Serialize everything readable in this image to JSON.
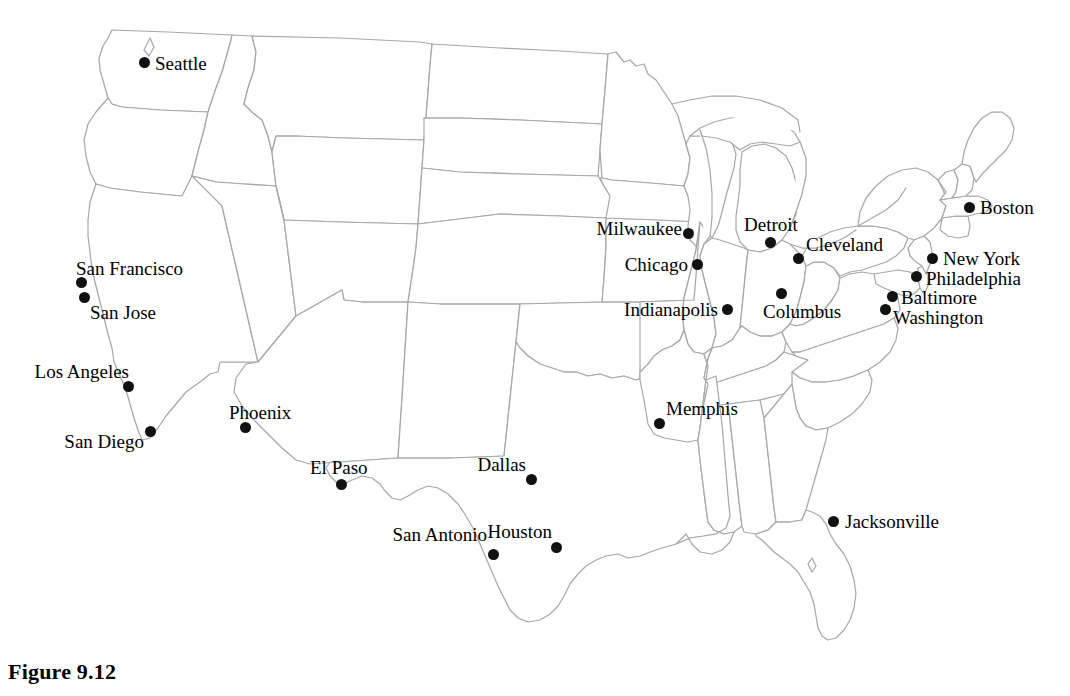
{
  "figure": {
    "caption": "Figure 9.12",
    "map_title": "United States city map",
    "background_color": "#ffffff",
    "border_color": "#a8a8a8",
    "marker_color": "#111111",
    "label_color": "#000000"
  },
  "map": {
    "region": "Contiguous United States",
    "width": 1070,
    "height": 652,
    "marker_diameter_px": 11,
    "label_font_size_px": 19
  },
  "cities": [
    {
      "name": "Seattle",
      "dot_x": 144,
      "dot_y": 62,
      "label_x": 155,
      "label_y": 63,
      "anchor": "left"
    },
    {
      "name": "San Francisco",
      "dot_x": 81,
      "dot_y": 282,
      "label_x": 76,
      "label_y": 268,
      "anchor": "left"
    },
    {
      "name": "San Jose",
      "dot_x": 84,
      "dot_y": 297,
      "label_x": 90,
      "label_y": 312,
      "anchor": "left"
    },
    {
      "name": "Los Angeles",
      "dot_x": 128,
      "dot_y": 386,
      "label_x": 129,
      "label_y": 371,
      "anchor": "right"
    },
    {
      "name": "San Diego",
      "dot_x": 150,
      "dot_y": 431,
      "label_x": 144,
      "label_y": 441,
      "anchor": "right"
    },
    {
      "name": "Phoenix",
      "dot_x": 245,
      "dot_y": 427,
      "label_x": 229,
      "label_y": 412,
      "anchor": "left"
    },
    {
      "name": "El Paso",
      "dot_x": 341,
      "dot_y": 484,
      "label_x": 310,
      "label_y": 467,
      "anchor": "left"
    },
    {
      "name": "Dallas",
      "dot_x": 531,
      "dot_y": 479,
      "label_x": 526,
      "label_y": 464,
      "anchor": "right"
    },
    {
      "name": "San Antonio",
      "dot_x": 493,
      "dot_y": 554,
      "label_x": 487,
      "label_y": 534,
      "anchor": "right"
    },
    {
      "name": "Houston",
      "dot_x": 556,
      "dot_y": 547,
      "label_x": 552,
      "label_y": 531,
      "anchor": "right"
    },
    {
      "name": "Memphis",
      "dot_x": 659,
      "dot_y": 423,
      "label_x": 666,
      "label_y": 408,
      "anchor": "left"
    },
    {
      "name": "Jacksonville",
      "dot_x": 833,
      "dot_y": 521,
      "label_x": 845,
      "label_y": 521,
      "anchor": "left"
    },
    {
      "name": "Milwaukee",
      "dot_x": 688,
      "dot_y": 233,
      "label_x": 682,
      "label_y": 228,
      "anchor": "right"
    },
    {
      "name": "Chicago",
      "dot_x": 697,
      "dot_y": 264,
      "label_x": 688,
      "label_y": 264,
      "anchor": "right"
    },
    {
      "name": "Detroit",
      "dot_x": 770,
      "dot_y": 242,
      "label_x": 744,
      "label_y": 224,
      "anchor": "left"
    },
    {
      "name": "Cleveland",
      "dot_x": 798,
      "dot_y": 258,
      "label_x": 806,
      "label_y": 244,
      "anchor": "left"
    },
    {
      "name": "Indianapolis",
      "dot_x": 727,
      "dot_y": 309,
      "label_x": 718,
      "label_y": 309,
      "anchor": "right"
    },
    {
      "name": "Columbus",
      "dot_x": 781,
      "dot_y": 293,
      "label_x": 763,
      "label_y": 311,
      "anchor": "left"
    },
    {
      "name": "Boston",
      "dot_x": 969,
      "dot_y": 207,
      "label_x": 980,
      "label_y": 207,
      "anchor": "left"
    },
    {
      "name": "New York",
      "dot_x": 932,
      "dot_y": 258,
      "label_x": 943,
      "label_y": 258,
      "anchor": "left"
    },
    {
      "name": "Philadelphia",
      "dot_x": 916,
      "dot_y": 276,
      "label_x": 926,
      "label_y": 278,
      "anchor": "left"
    },
    {
      "name": "Baltimore",
      "dot_x": 892,
      "dot_y": 296,
      "label_x": 901,
      "label_y": 297,
      "anchor": "left"
    },
    {
      "name": "Washington",
      "dot_x": 885,
      "dot_y": 309,
      "label_x": 893,
      "label_y": 317,
      "anchor": "left"
    }
  ]
}
